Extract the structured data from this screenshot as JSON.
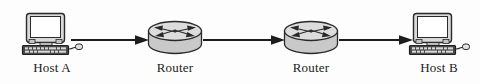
{
  "diagram": {
    "background_color": "#fdfdfd",
    "line_color": "#1c1c1c",
    "label_color": "#1a1a1a",
    "device_fill": "#d6d6d6",
    "device_stroke": "#2a2a2a",
    "screen_fill": "#ffffff",
    "nodes": [
      {
        "id": "host-a",
        "type": "host",
        "label": "Host A",
        "icon": "desktop-computer-icon",
        "x": 18
      },
      {
        "id": "router-1",
        "type": "router",
        "label": "Router",
        "icon": "router-cylinder-icon",
        "x": 147
      },
      {
        "id": "router-2",
        "type": "router",
        "label": "Router",
        "icon": "router-cylinder-icon",
        "x": 283
      },
      {
        "id": "host-b",
        "type": "host",
        "label": "Host B",
        "icon": "desktop-computer-icon",
        "x": 405
      }
    ],
    "connectors": [
      {
        "id": "link-host-a-router-1",
        "from": "host-a",
        "to": "router-1",
        "direction": "right",
        "x": 71,
        "width": 78
      },
      {
        "id": "link-router-1-router-2",
        "from": "router-1",
        "to": "router-2",
        "direction": "right",
        "x": 203,
        "width": 82
      },
      {
        "id": "link-router-2-host-b",
        "from": "router-2",
        "to": "host-b",
        "direction": "right",
        "x": 339,
        "width": 74
      }
    ]
  }
}
